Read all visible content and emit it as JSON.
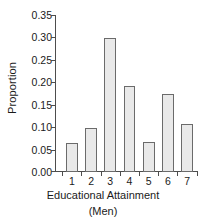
{
  "chart_data": {
    "type": "bar",
    "title": "",
    "xlabel": "Educational Attainment",
    "xlabel_line2": "(Men)",
    "ylabel": "Proportion",
    "categories": [
      "1",
      "2",
      "3",
      "4",
      "5",
      "6",
      "7"
    ],
    "values": [
      0.065,
      0.099,
      0.299,
      0.192,
      0.068,
      0.174,
      0.107
    ],
    "ylim": [
      0.0,
      0.35
    ],
    "ytick_values": [
      0.0,
      0.05,
      0.1,
      0.15,
      0.2,
      0.25,
      0.3,
      0.35
    ],
    "ytick_labels": [
      "0.00",
      "0.05",
      "0.10",
      "0.15",
      "0.20",
      "0.25",
      "0.30",
      "0.35"
    ],
    "grid": false,
    "legend": "none",
    "bar_fill_color": "#e9e9e9",
    "bar_edge_color": "#6b6b6b",
    "axis_color": "#4d4d4d",
    "background_color": "#ffffff"
  }
}
